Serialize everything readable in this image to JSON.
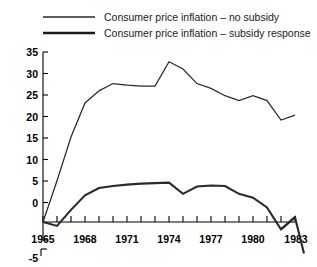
{
  "chart_data": {
    "type": "line",
    "title": "",
    "xlabel": "",
    "ylabel": "",
    "xlim": [
      1965,
      1983
    ],
    "ylim": [
      -5,
      35
    ],
    "grid": false,
    "legend_position": "top",
    "y_ticks": [
      -5,
      0,
      5,
      10,
      15,
      20,
      25,
      30,
      35
    ],
    "y_tick_labels": [
      "-5",
      "0",
      "5",
      "10",
      "15",
      "20",
      "25",
      "30",
      "35"
    ],
    "x_ticks": [
      1965,
      1966,
      1967,
      1968,
      1969,
      1970,
      1971,
      1972,
      1973,
      1974,
      1975,
      1976,
      1977,
      1978,
      1979,
      1980,
      1981,
      1982,
      1983
    ],
    "x_tick_labels": [
      "1965",
      "1968",
      "1971",
      "1974",
      "1977",
      "1980",
      "1983"
    ],
    "x_labeled_ticks": [
      1965,
      1968,
      1971,
      1974,
      1977,
      1980,
      1983
    ],
    "x": [
      1965,
      1966,
      1967,
      1968,
      1969,
      1970,
      1971,
      1972,
      1973,
      1974,
      1975,
      1976,
      1977,
      1978,
      1979,
      1980,
      1981,
      1982,
      1983
    ],
    "series": [
      {
        "name": "Consumer price inflation – no subsidy",
        "style": "thin",
        "color": "#2a2a2a",
        "values": [
          0,
          8.5,
          17.5,
          24.5,
          27.0,
          28.5,
          28.2,
          28.0,
          28.0,
          33.0,
          31.5,
          28.5,
          27.5,
          26.0,
          25.0,
          26.0,
          25.0,
          21.0,
          22.0
        ]
      },
      {
        "name": "Consumer price inflation – subsidy response",
        "style": "thick",
        "color": "#1a1a1a",
        "values": [
          0,
          -0.8,
          2.5,
          5.5,
          7.0,
          7.4,
          7.7,
          7.9,
          8.0,
          8.1,
          5.8,
          7.3,
          7.5,
          7.4,
          5.8,
          5.0,
          3.0,
          -1.5,
          1.0
        ]
      }
    ],
    "annotations": [
      "Subsidy-response series continues below axis after 1982, ending near -6 at 1983"
    ]
  },
  "legend": {
    "items": [
      {
        "label": "Consumer price inflation – no subsidy",
        "swatch": "thin-line-swatch"
      },
      {
        "label": "Consumer price inflation – subsidy response",
        "swatch": "thick-line-swatch"
      }
    ]
  }
}
